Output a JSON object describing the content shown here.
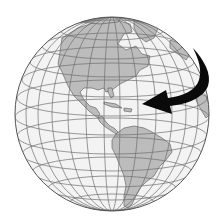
{
  "figure": {
    "subject": "Earth globe showing the Americas with a curved rotation arrow",
    "globe": {
      "center": [
        112,
        114
      ],
      "radius": 97,
      "ocean_color": "#f3f3f3",
      "land_color": "#bcbcbc",
      "grid_color": "#6e6e6e",
      "outline_color": "#555555"
    },
    "arrow": {
      "color": "#0a0a0a",
      "direction": "right-to-left (west)",
      "meaning": "rotation-arrow"
    },
    "regions": [
      "North America",
      "Central America",
      "Caribbean",
      "South America",
      "Greenland",
      "Europe/Africa edge"
    ]
  }
}
